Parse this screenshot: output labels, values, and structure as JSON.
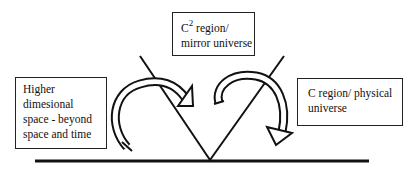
{
  "diagram": {
    "boxes": {
      "left": {
        "lines": [
          "Higher",
          "dimesional",
          "space - beyond",
          "space and time"
        ]
      },
      "top": {
        "line1_base": "C",
        "line1_sup": "2",
        "line1_rest": " region/",
        "line2": "mirror universe"
      },
      "right": {
        "lines": [
          "C region/ physical",
          "universe"
        ]
      }
    },
    "arrows": [
      {
        "name": "left-curved-arrow",
        "direction": "from higher dimensional space toward V center"
      },
      {
        "name": "right-curved-arrow",
        "direction": "from V center toward C region"
      }
    ],
    "colors": {
      "stroke": "#111111",
      "background": "#ffffff"
    }
  }
}
